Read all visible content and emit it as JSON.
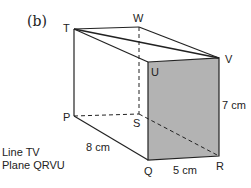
{
  "figure": {
    "part_label": "(b)",
    "vertices": {
      "T": "T",
      "W": "W",
      "V": "V",
      "U": "U",
      "P": "P",
      "S": "S",
      "Q": "Q",
      "R": "R"
    },
    "dimensions": {
      "height": "7 cm",
      "width": "5 cm",
      "length": "8 cm"
    },
    "shaded_face": "QRVU",
    "colors": {
      "shade": "#b3b3b3",
      "line": "#222222"
    }
  },
  "notes": {
    "line": "Line TV",
    "plane": "Plane QRVU"
  }
}
